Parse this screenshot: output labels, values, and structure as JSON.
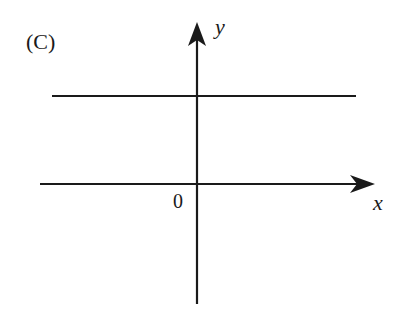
{
  "diagram": {
    "panel_label": "(C)",
    "axes": {
      "x_label": "x",
      "y_label": "y",
      "origin_label": "0"
    },
    "line": {
      "type": "horizontal",
      "position": "above x-axis"
    },
    "colors": {
      "stroke": "#1a1a1a",
      "background": "#ffffff"
    }
  }
}
